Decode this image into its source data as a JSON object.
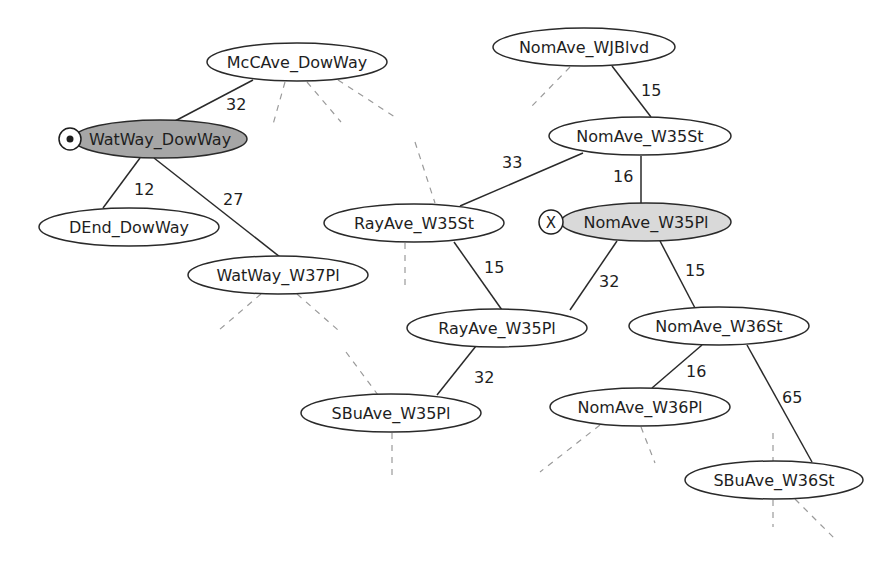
{
  "diagram": {
    "type": "graph-search-tree",
    "colors": {
      "start_fill": "#a6a6a6",
      "goal_fill": "#d9d9d9",
      "node_fill": "#ffffff",
      "edge": "#2a2a2a",
      "dashed_edge": "#9a9a9a"
    },
    "nodes": [
      {
        "id": "McCAve_DowWay",
        "label": "McCAve_DowWay",
        "cx": 297,
        "cy": 62,
        "rx": 90,
        "ry": 19,
        "style": "normal"
      },
      {
        "id": "WatWay_DowWay",
        "label": "WatWay_DowWay",
        "cx": 160,
        "cy": 139,
        "rx": 87,
        "ry": 19,
        "style": "start",
        "icon": "start-target-icon"
      },
      {
        "id": "DEnd_DowWay",
        "label": "DEnd_DowWay",
        "cx": 129,
        "cy": 227,
        "rx": 90,
        "ry": 19,
        "style": "normal"
      },
      {
        "id": "WatWay_W37Pl",
        "label": "WatWay_W37Pl",
        "cx": 278,
        "cy": 275,
        "rx": 90,
        "ry": 19,
        "style": "normal"
      },
      {
        "id": "NomAve_WJBlvd",
        "label": "NomAve_WJBlvd",
        "cx": 584,
        "cy": 47,
        "rx": 91,
        "ry": 19,
        "style": "normal"
      },
      {
        "id": "NomAve_W35St",
        "label": "NomAve_W35St",
        "cx": 640,
        "cy": 136,
        "rx": 91,
        "ry": 19,
        "style": "normal"
      },
      {
        "id": "RayAve_W35St",
        "label": "RayAve_W35St",
        "cx": 414,
        "cy": 223,
        "rx": 90,
        "ry": 19,
        "style": "normal"
      },
      {
        "id": "NomAve_W35Pl",
        "label": "NomAve_W35Pl",
        "cx": 646,
        "cy": 222,
        "rx": 85,
        "ry": 19,
        "style": "goal",
        "icon": "goal-x-icon"
      },
      {
        "id": "RayAve_W35Pl",
        "label": "RayAve_W35Pl",
        "cx": 497,
        "cy": 328,
        "rx": 90,
        "ry": 19,
        "style": "normal"
      },
      {
        "id": "NomAve_W36St",
        "label": "NomAve_W36St",
        "cx": 719,
        "cy": 326,
        "rx": 90,
        "ry": 19,
        "style": "normal"
      },
      {
        "id": "SBuAve_W35Pl",
        "label": "SBuAve_W35Pl",
        "cx": 391,
        "cy": 413,
        "rx": 90,
        "ry": 19,
        "style": "normal"
      },
      {
        "id": "NomAve_W36Pl",
        "label": "NomAve_W36Pl",
        "cx": 640,
        "cy": 407,
        "rx": 90,
        "ry": 19,
        "style": "normal"
      },
      {
        "id": "SBuAve_W36St",
        "label": "SBuAve_W36St",
        "cx": 774,
        "cy": 480,
        "rx": 89,
        "ry": 19,
        "style": "normal"
      }
    ],
    "edges": [
      {
        "from": "McCAve_DowWay",
        "to": "WatWay_DowWay",
        "weight": "32",
        "x1": 253,
        "y1": 80,
        "x2": 175,
        "y2": 121,
        "lx": 226,
        "ly": 110
      },
      {
        "from": "WatWay_DowWay",
        "to": "DEnd_DowWay",
        "weight": "12",
        "x1": 140,
        "y1": 158,
        "x2": 103,
        "y2": 208,
        "lx": 134,
        "ly": 195
      },
      {
        "from": "WatWay_DowWay",
        "to": "WatWay_W37Pl",
        "weight": "27",
        "x1": 154,
        "y1": 158,
        "x2": 280,
        "y2": 257,
        "lx": 223,
        "ly": 205
      },
      {
        "from": "NomAve_WJBlvd",
        "to": "NomAve_W35St",
        "weight": "15",
        "x1": 612,
        "y1": 66,
        "x2": 651,
        "y2": 117,
        "lx": 641,
        "ly": 96
      },
      {
        "from": "NomAve_W35St",
        "to": "RayAve_W35St",
        "weight": "33",
        "x1": 583,
        "y1": 153,
        "x2": 460,
        "y2": 206,
        "lx": 502,
        "ly": 168
      },
      {
        "from": "NomAve_W35St",
        "to": "NomAve_W35Pl",
        "weight": "16",
        "x1": 641,
        "y1": 156,
        "x2": 641,
        "y2": 203,
        "lx": 613,
        "ly": 182
      },
      {
        "from": "RayAve_W35St",
        "to": "RayAve_W35Pl",
        "weight": "15",
        "x1": 454,
        "y1": 242,
        "x2": 502,
        "y2": 310,
        "lx": 484,
        "ly": 273
      },
      {
        "from": "NomAve_W35Pl",
        "to": "RayAve_W35Pl",
        "weight": "32",
        "x1": 617,
        "y1": 241,
        "x2": 570,
        "y2": 310,
        "lx": 599,
        "ly": 287
      },
      {
        "from": "NomAve_W35Pl",
        "to": "NomAve_W36St",
        "weight": "15",
        "x1": 660,
        "y1": 241,
        "x2": 695,
        "y2": 308,
        "lx": 685,
        "ly": 276
      },
      {
        "from": "RayAve_W35Pl",
        "to": "SBuAve_W35Pl",
        "weight": "32",
        "x1": 476,
        "y1": 346,
        "x2": 437,
        "y2": 395,
        "lx": 474,
        "ly": 383
      },
      {
        "from": "NomAve_W36St",
        "to": "NomAve_W36Pl",
        "weight": "16",
        "x1": 702,
        "y1": 345,
        "x2": 652,
        "y2": 388,
        "lx": 686,
        "ly": 377
      },
      {
        "from": "NomAve_W36St",
        "to": "SBuAve_W36St",
        "weight": "65",
        "x1": 747,
        "y1": 345,
        "x2": 812,
        "y2": 462,
        "lx": 782,
        "ly": 403
      }
    ],
    "dashed_edges": [
      {
        "x1": 285,
        "y1": 82,
        "x2": 272,
        "y2": 128
      },
      {
        "x1": 307,
        "y1": 82,
        "x2": 341,
        "y2": 122
      },
      {
        "x1": 338,
        "y1": 80,
        "x2": 395,
        "y2": 117
      },
      {
        "x1": 415,
        "y1": 142,
        "x2": 435,
        "y2": 203
      },
      {
        "x1": 570,
        "y1": 67,
        "x2": 531,
        "y2": 107
      },
      {
        "x1": 405,
        "y1": 243,
        "x2": 405,
        "y2": 290
      },
      {
        "x1": 261,
        "y1": 294,
        "x2": 219,
        "y2": 330
      },
      {
        "x1": 297,
        "y1": 294,
        "x2": 338,
        "y2": 330
      },
      {
        "x1": 346,
        "y1": 352,
        "x2": 378,
        "y2": 395
      },
      {
        "x1": 392,
        "y1": 433,
        "x2": 392,
        "y2": 478
      },
      {
        "x1": 600,
        "y1": 425,
        "x2": 540,
        "y2": 472
      },
      {
        "x1": 641,
        "y1": 427,
        "x2": 655,
        "y2": 463
      },
      {
        "x1": 773,
        "y1": 433,
        "x2": 773,
        "y2": 461
      },
      {
        "x1": 773,
        "y1": 500,
        "x2": 773,
        "y2": 527
      },
      {
        "x1": 795,
        "y1": 499,
        "x2": 834,
        "y2": 538
      }
    ],
    "icons": {
      "start": {
        "name": "start-target-icon",
        "cx": 70,
        "cy": 139,
        "r": 11
      },
      "goal": {
        "name": "goal-x-icon",
        "cx": 551,
        "cy": 222,
        "r": 12,
        "glyph": "X"
      }
    }
  }
}
